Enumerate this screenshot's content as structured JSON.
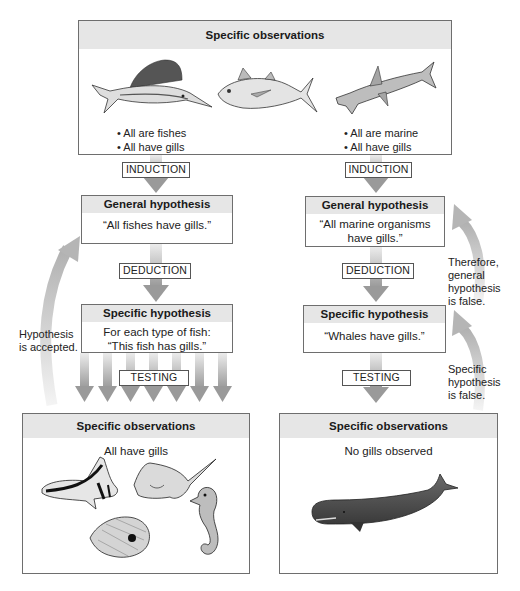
{
  "top_box": {
    "title": "Specific observations",
    "left_bullets": [
      "• All are fishes",
      "• All have gills"
    ],
    "right_bullets": [
      "• All are marine",
      "• All have gills"
    ],
    "animals": [
      "sailfish",
      "tuna",
      "hammerhead-shark"
    ]
  },
  "left_branch": {
    "induction_label": "INDUCTION",
    "general_hypothesis": {
      "title": "General hypothesis",
      "text_lines": [
        "“All fishes have gills.”"
      ]
    },
    "deduction_label": "DEDUCTION",
    "specific_hypothesis": {
      "title": "Specific hypothesis",
      "text_lines": [
        "For each type of fish:",
        "“This fish has gills.”"
      ]
    },
    "testing_label": "TESTING",
    "feedback_note_lines": [
      "Hypothesis",
      "is accepted."
    ],
    "observations": {
      "title": "Specific observations",
      "text": "All have gills",
      "animals": [
        "moorish-idol",
        "stingray",
        "butterflyfish",
        "seahorse"
      ]
    }
  },
  "right_branch": {
    "induction_label": "INDUCTION",
    "general_hypothesis": {
      "title": "General hypothesis",
      "text_lines": [
        "“All marine organisms",
        "have gills.”"
      ]
    },
    "deduction_label": "DEDUCTION",
    "specific_hypothesis": {
      "title": "Specific hypothesis",
      "text_lines": [
        "“Whales have gills.”"
      ]
    },
    "testing_label": "TESTING",
    "feedback_note_upper_lines": [
      "Therefore,",
      "general",
      "hypothesis",
      "is false."
    ],
    "feedback_note_lower_lines": [
      "Specific",
      "hypothesis",
      "is false."
    ],
    "observations": {
      "title": "Specific observations",
      "text": "No gills observed",
      "animals": [
        "sperm-whale"
      ]
    }
  },
  "colors": {
    "header_fill": "#e6e6e6",
    "border": "#6e6e6e",
    "arrow": "#9a9a9a",
    "arrow_light": "#d4d4d4"
  }
}
